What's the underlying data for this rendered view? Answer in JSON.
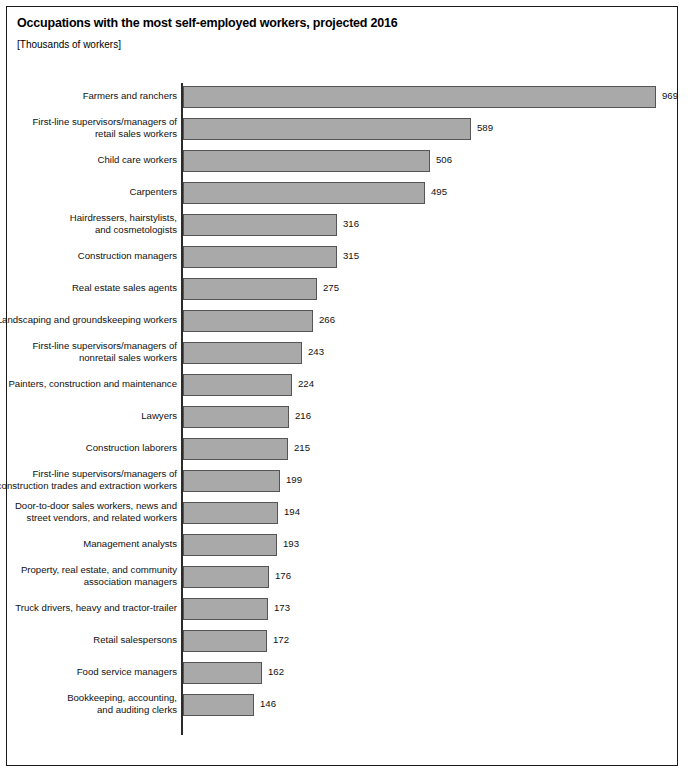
{
  "figure": {
    "title": "Occupations with the most self-employed workers, projected 2016",
    "subtitle": "[Thousands of workers]"
  },
  "chart_data": {
    "type": "bar",
    "orientation": "horizontal",
    "title": "Occupations with the most self-employed workers, projected 2016",
    "subtitle": "[Thousands of workers]",
    "xlabel": "",
    "ylabel": "",
    "units": "Thousands of workers",
    "grid": false,
    "legend": null,
    "xlim": [
      0,
      969
    ],
    "data_labels": true,
    "categories": [
      "Farmers and ranchers",
      "First-line supervisors/managers of retail sales workers",
      "Child care workers",
      "Carpenters",
      "Hairdressers, hairstylists, and cosmetologists",
      "Construction managers",
      "Real estate sales agents",
      "Landscaping and groundskeeping workers",
      "First-line supervisors/managers of nonretail sales workers",
      "Painters, construction and maintenance",
      "Lawyers",
      "Construction laborers",
      "First-line supervisors/managers of construction trades and extraction workers",
      "Door-to-door sales workers, news and street vendors, and related workers",
      "Management analysts",
      "Property, real estate, and community association managers",
      "Truck drivers, heavy and tractor-trailer",
      "Retail salespersons",
      "Food service managers",
      "Bookkeeping, accounting, and auditing clerks"
    ],
    "values": [
      969,
      589,
      506,
      495,
      316,
      315,
      275,
      266,
      243,
      224,
      216,
      215,
      199,
      194,
      193,
      176,
      173,
      172,
      162,
      146
    ]
  },
  "bars": [
    {
      "label_line1": "Farmers and ranchers",
      "label_line2": "",
      "value": 969,
      "value_text": "969"
    },
    {
      "label_line1": "First-line supervisors/managers of",
      "label_line2": "retail sales workers",
      "value": 589,
      "value_text": "589"
    },
    {
      "label_line1": "Child care workers",
      "label_line2": "",
      "value": 506,
      "value_text": "506"
    },
    {
      "label_line1": "Carpenters",
      "label_line2": "",
      "value": 495,
      "value_text": "495"
    },
    {
      "label_line1": "Hairdressers, hairstylists,",
      "label_line2": "and cosmetologists",
      "value": 316,
      "value_text": "316"
    },
    {
      "label_line1": "Construction managers",
      "label_line2": "",
      "value": 315,
      "value_text": "315"
    },
    {
      "label_line1": "Real estate sales agents",
      "label_line2": "",
      "value": 275,
      "value_text": "275"
    },
    {
      "label_line1": "Landscaping and groundskeeping workers",
      "label_line2": "",
      "value": 266,
      "value_text": "266"
    },
    {
      "label_line1": "First-line supervisors/managers of",
      "label_line2": "nonretail sales workers",
      "value": 243,
      "value_text": "243"
    },
    {
      "label_line1": "Painters, construction and maintenance",
      "label_line2": "",
      "value": 224,
      "value_text": "224"
    },
    {
      "label_line1": "Lawyers",
      "label_line2": "",
      "value": 216,
      "value_text": "216"
    },
    {
      "label_line1": "Construction laborers",
      "label_line2": "",
      "value": 215,
      "value_text": "215"
    },
    {
      "label_line1": "First-line supervisors/managers of",
      "label_line2": "construction trades and extraction workers",
      "value": 199,
      "value_text": "199"
    },
    {
      "label_line1": "Door-to-door sales workers, news and",
      "label_line2": "street vendors, and related workers",
      "value": 194,
      "value_text": "194"
    },
    {
      "label_line1": "Management analysts",
      "label_line2": "",
      "value": 193,
      "value_text": "193"
    },
    {
      "label_line1": "Property, real estate, and community",
      "label_line2": "association managers",
      "value": 176,
      "value_text": "176"
    },
    {
      "label_line1": "Truck drivers, heavy and tractor-trailer",
      "label_line2": "",
      "value": 173,
      "value_text": "173"
    },
    {
      "label_line1": "Retail salespersons",
      "label_line2": "",
      "value": 172,
      "value_text": "172"
    },
    {
      "label_line1": "Food service managers",
      "label_line2": "",
      "value": 162,
      "value_text": "162"
    },
    {
      "label_line1": "Bookkeeping, accounting,",
      "label_line2": "and auditing clerks",
      "value": 146,
      "value_text": "146"
    }
  ],
  "style": {
    "bar_fill": "#a9a9a9",
    "bar_stroke": "#555555",
    "axis_color": "#2b2b2b",
    "border_color": "#1a1a1a",
    "text_color": "#111111",
    "background": "#ffffff"
  },
  "scale": {
    "px_per_unit": 0.4885,
    "axis_x_px": 176,
    "row_pitch_px": 32,
    "bar_height_px": 22
  }
}
